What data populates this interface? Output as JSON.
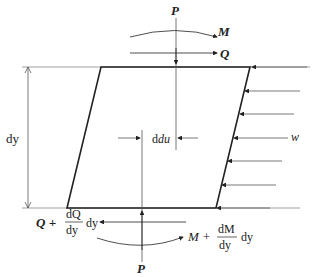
{
  "diagram": {
    "labels": {
      "P_top": "P",
      "M_top": "M",
      "Q_top": "Q",
      "dy": "dy",
      "du": "du",
      "w": "w",
      "P_bottom": "P",
      "Q_bottom_base": "Q +",
      "Q_bottom_num": "dQ",
      "Q_bottom_den": "dy",
      "Q_bottom_tail": "dy",
      "M_bottom_base": "M +",
      "M_bottom_num": "dM",
      "M_bottom_den": "dy",
      "M_bottom_tail": "dy"
    },
    "colors": {
      "stroke": "#222222",
      "guide": "#888888"
    }
  }
}
